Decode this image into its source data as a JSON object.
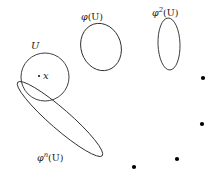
{
  "figure": {
    "type": "mathematical-diagram",
    "background_color": "#ffffff",
    "stroke_color": "#2b2b2b",
    "dot_color": "#000000",
    "labels": {
      "u": "U",
      "point_x": "x",
      "phi_u_base": "φ",
      "phi_u_arg": "(U)",
      "phi2_u_base": "φ",
      "phi2_u_sup": "2",
      "phi2_u_arg": "(U)",
      "phin_u_base": "φ",
      "phin_u_sup": "n",
      "phin_u_arg": "(U)"
    },
    "shapes": [
      {
        "name": "set-u-circle",
        "kind": "circle",
        "cx": 45,
        "cy": 77,
        "r": 24
      },
      {
        "name": "set-phi-u-ellipse",
        "kind": "ellipse",
        "cx": 101,
        "cy": 47,
        "rx": 20,
        "ry": 24,
        "rotation": -18
      },
      {
        "name": "set-phi2-u-ellipse",
        "kind": "ellipse",
        "cx": 169,
        "cy": 44,
        "rx": 11,
        "ry": 26,
        "rotation": -2
      },
      {
        "name": "set-phin-u-ellipse",
        "kind": "ellipse",
        "cx": 60,
        "cy": 119,
        "rx": 56,
        "ry": 10,
        "rotation": 41
      }
    ],
    "marker_point": {
      "name": "point-x-marker",
      "cx": 39,
      "cy": 76,
      "r": 1.1
    },
    "ellipsis_dots": [
      {
        "cx": 203,
        "cy": 78,
        "r": 2.1
      },
      {
        "cx": 202,
        "cy": 124,
        "r": 2.1
      },
      {
        "cx": 177,
        "cy": 159,
        "r": 2.1
      },
      {
        "cx": 134,
        "cy": 167,
        "r": 2.1
      }
    ]
  }
}
